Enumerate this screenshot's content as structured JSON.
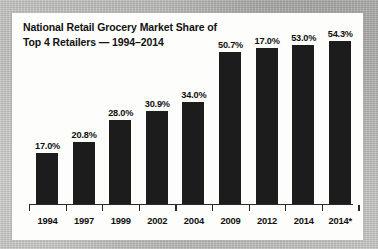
{
  "background": {
    "kind": "scanned-paper",
    "color": "#bdbdbb"
  },
  "card": {
    "color": "#fdfdfc"
  },
  "chart_data": {
    "type": "bar",
    "title": "National Retail Grocery Market Share of Top 4 Retailers — 1994–2014",
    "title_lines": [
      "National Retail Grocery Market Share of",
      "Top 4 Retailers — 1994–2014"
    ],
    "xlabel": "",
    "ylabel": "",
    "categories": [
      "1994",
      "1997",
      "1999",
      "2002",
      "2004",
      "2009",
      "2012",
      "2014",
      "2014*"
    ],
    "values": [
      17.0,
      20.8,
      28.0,
      30.9,
      34.0,
      50.7,
      52.0,
      53.0,
      54.3
    ],
    "data_labels": [
      "17.0%",
      "20.8%",
      "28.0%",
      "30.9%",
      "34.0%",
      "50.7%",
      "17.0%",
      "53.0%",
      "54.3%"
    ],
    "ylim": [
      0,
      57
    ],
    "grid": false,
    "legend": false,
    "bar_color": "#1c1c1c",
    "axis_color": "#2a2a2a"
  }
}
